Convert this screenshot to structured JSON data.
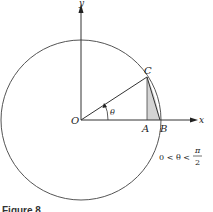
{
  "figure": {
    "caption": "Figure 8",
    "labels": {
      "y_axis": "y",
      "x_axis": "x",
      "origin": "O",
      "point_a": "A",
      "point_b": "B",
      "point_c": "C",
      "angle": "θ"
    },
    "condition": {
      "left": "0 < θ <",
      "numerator": "π",
      "denominator": "2"
    },
    "colors": {
      "stroke": "#333333",
      "circle": "#555555",
      "shade": "#d4d4d4"
    }
  }
}
